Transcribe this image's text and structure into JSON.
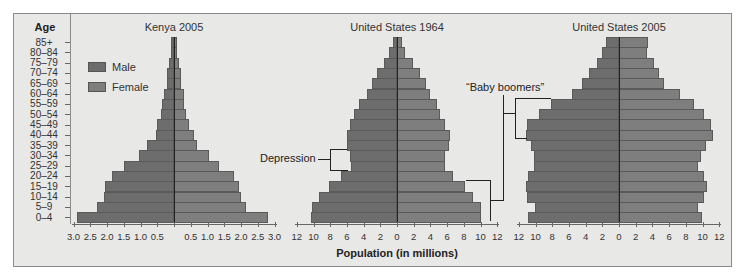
{
  "chart_data": {
    "type": "bar",
    "subtype": "population-pyramid",
    "y_axis_title": "Age",
    "x_axis_title": "Population (in millions)",
    "legend": [
      {
        "label": "Male",
        "color": "#6d6d6d"
      },
      {
        "label": "Female",
        "color": "#7e7e7e"
      }
    ],
    "categories": [
      "85+",
      "80–84",
      "75–79",
      "70–74",
      "65–69",
      "60–64",
      "55–59",
      "50–54",
      "45–49",
      "40–44",
      "35–39",
      "30–34",
      "25–29",
      "20–24",
      "15–19",
      "10–14",
      "5–9",
      "0–4"
    ],
    "charts": [
      {
        "title": "Kenya 2005",
        "xlim": [
          3.0,
          3.0
        ],
        "left_ticks": [
          "3.0",
          "2.5",
          "2.0",
          "1.5",
          "1.0",
          "0.5"
        ],
        "right_ticks": [
          "0.5",
          "1.0",
          "1.5",
          "2.0",
          "2.5",
          "3.0"
        ],
        "series": [
          {
            "name": "Male",
            "values": [
              0.1,
              0.1,
              0.15,
              0.2,
              0.2,
              0.3,
              0.35,
              0.4,
              0.5,
              0.55,
              0.8,
              1.05,
              1.5,
              1.85,
              2.05,
              2.1,
              2.3,
              2.9
            ]
          },
          {
            "name": "Female",
            "values": [
              0.1,
              0.1,
              0.15,
              0.2,
              0.2,
              0.3,
              0.3,
              0.35,
              0.45,
              0.6,
              0.7,
              1.05,
              1.35,
              1.8,
              1.95,
              2.0,
              2.15,
              2.8
            ]
          }
        ]
      },
      {
        "title": "United States 1964",
        "xlim": [
          12,
          12
        ],
        "left_ticks": [
          "12",
          "10",
          "8",
          "6",
          "4",
          "2"
        ],
        "center_tick": "0",
        "right_ticks": [
          "2",
          "4",
          "6",
          "8",
          "10",
          "12"
        ],
        "series": [
          {
            "name": "Male",
            "values": [
              0.5,
              0.9,
              1.6,
              2.4,
              3.0,
              3.6,
              4.5,
              5.1,
              5.6,
              6.0,
              6.0,
              5.6,
              5.5,
              6.7,
              8.2,
              9.4,
              10.2,
              10.3
            ]
          },
          {
            "name": "Female",
            "values": [
              0.6,
              1.0,
              1.9,
              2.7,
              3.5,
              4.0,
              4.8,
              5.2,
              5.7,
              6.3,
              6.2,
              5.7,
              5.7,
              6.7,
              8.1,
              9.1,
              10.0,
              10.0
            ]
          }
        ]
      },
      {
        "title": "United States 2005",
        "xlim": [
          12,
          12
        ],
        "left_ticks": [
          "12",
          "10",
          "8",
          "6",
          "4",
          "2"
        ],
        "center_tick": "0",
        "right_ticks": [
          "2",
          "4",
          "6",
          "8",
          "10",
          "12"
        ],
        "series": [
          {
            "name": "Male",
            "values": [
              1.5,
              2.0,
              2.6,
              3.6,
              4.4,
              5.6,
              8.1,
              9.6,
              11.0,
              11.1,
              10.5,
              10.2,
              10.2,
              10.9,
              11.1,
              11.0,
              10.1,
              10.9
            ]
          },
          {
            "name": "Female",
            "values": [
              3.5,
              3.4,
              4.2,
              4.8,
              5.4,
              7.3,
              9.0,
              10.2,
              11.0,
              11.3,
              10.4,
              9.8,
              9.5,
              10.2,
              10.5,
              10.2,
              9.5,
              9.9
            ]
          }
        ]
      }
    ],
    "annotations": [
      {
        "text": "Depression",
        "target": "United States 1964, ages 25–34"
      },
      {
        "text": "“Baby boomers”",
        "target": "US 1964 ages 0–19 → US 2005 ages 40–59"
      }
    ],
    "grid": false,
    "legend_position": "upper-left (inside Kenya panel)"
  }
}
